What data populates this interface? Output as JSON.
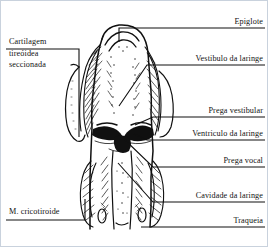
{
  "figure": {
    "title_alt": "Corte coronal da laringe",
    "background_color": "#ffffff",
    "ink_color": "#101010",
    "border_color": "#c9d2dd"
  },
  "labels": {
    "left": [
      {
        "id": "cartilagem-tireoidea-seccionada",
        "text": "Cartilagem\ntireóidea\nseccionada",
        "x": 8,
        "y": 36,
        "align": "left"
      },
      {
        "id": "m-cricotiroide",
        "text": "M. cricotiroide",
        "x": 8,
        "y": 208,
        "align": "left"
      }
    ],
    "right": [
      {
        "id": "epiglote",
        "text": "Epiglote",
        "x": 168,
        "y": 16,
        "align": "right"
      },
      {
        "id": "vestibulo-da-laringe",
        "text": "Vestibulo da laringe",
        "x": 108,
        "y": 54,
        "align": "right"
      },
      {
        "id": "prega-vestibular",
        "text": "Prega vestibular",
        "x": 118,
        "y": 105,
        "align": "right"
      },
      {
        "id": "ventriculo-da-laringe",
        "text": "Ventriculo da laringe",
        "x": 100,
        "y": 128,
        "align": "right"
      },
      {
        "id": "prega-vocal",
        "text": "Prega vocal",
        "x": 128,
        "y": 155,
        "align": "right"
      },
      {
        "id": "cavidade-da-laringe",
        "text": "Cavidade da laringe",
        "x": 108,
        "y": 190,
        "align": "right"
      },
      {
        "id": "traqueia",
        "text": "Traqueia",
        "x": 158,
        "y": 215,
        "align": "right"
      }
    ]
  },
  "anatomy_parts": [
    "epiglottis",
    "laryngeal-vestibule",
    "vestibular-fold",
    "laryngeal-ventricle",
    "vocal-fold",
    "laryngeal-cavity",
    "trachea",
    "thyroid-cartilage",
    "cricothyroid-muscle"
  ]
}
